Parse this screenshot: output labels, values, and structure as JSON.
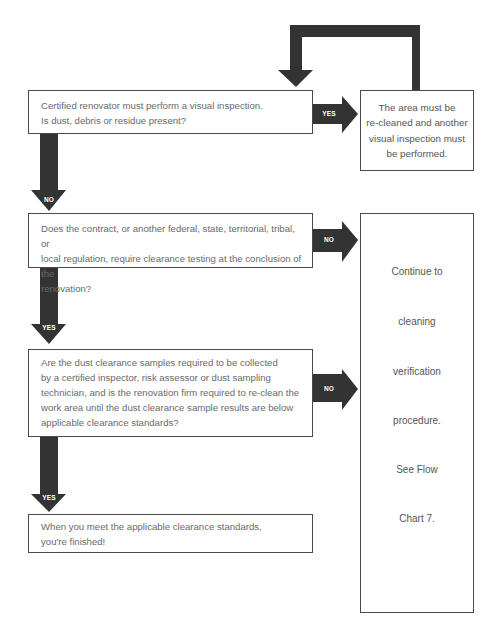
{
  "flowchart": {
    "colors": {
      "arrow": "#333333",
      "border": "#4a4a4a",
      "text": "#6a6a6a"
    },
    "step1": {
      "text": "Certified renovator must perform a visual inspection.\nIs dust, debris or residue present?"
    },
    "step1_yes_label": "YES",
    "step1_yes_result": {
      "text": "The area must be\nre-cleaned and another\nvisual inspection must\nbe performed."
    },
    "step1_no_label": "NO",
    "step2": {
      "text": "Does the contract, or another federal, state, territorial, tribal, or\nlocal regulation, require clearance testing at the conclusion of the\nrenovation?"
    },
    "step2_no_label": "NO",
    "step2_yes_label": "YES",
    "step3": {
      "text": "Are the dust clearance samples required to be collected\nby a certified inspector, risk assessor or dust sampling\ntechnician, and is the renovation firm required to re-clean the\nwork area until the dust clearance sample results are below\napplicable clearance standards?"
    },
    "step3_no_label": "NO",
    "step3_yes_label": "YES",
    "final": {
      "text": "When you meet the applicable clearance standards,\nyou're finished!"
    },
    "side_result": {
      "lines": [
        "Continue to",
        "cleaning",
        "verification",
        "procedure.",
        "See Flow",
        "Chart 7."
      ]
    }
  }
}
